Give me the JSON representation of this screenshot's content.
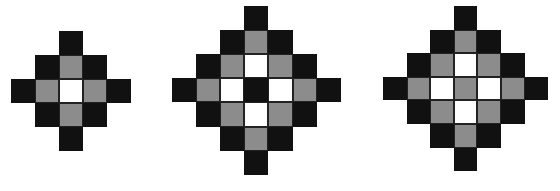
{
  "figures": [
    {
      "name": "diamond-small",
      "x": 11,
      "y": 31,
      "cell": 24,
      "grid": [
        "..B..",
        ".BGB.",
        "BGWGB",
        ".BGB.",
        "..B.."
      ]
    },
    {
      "name": "diamond-large-black-center",
      "x": 172,
      "y": 6,
      "cell": 24.1,
      "grid": [
        "...B...",
        "..BGB..",
        ".BGWGB.",
        "BGWBWGB",
        ".BGWGB.",
        "..BGB..",
        "...B..."
      ]
    },
    {
      "name": "diamond-large-gray-center",
      "x": 383,
      "y": 6,
      "cell": 23.6,
      "grid": [
        "...B...",
        "..BGB..",
        ".BGWGB.",
        "BGWGWGB",
        ".BGWGB.",
        "..BGB..",
        "...B..."
      ]
    }
  ],
  "colors": {
    "black": "#111111",
    "gray": "#8c8c8c",
    "white": "#ffffff"
  }
}
